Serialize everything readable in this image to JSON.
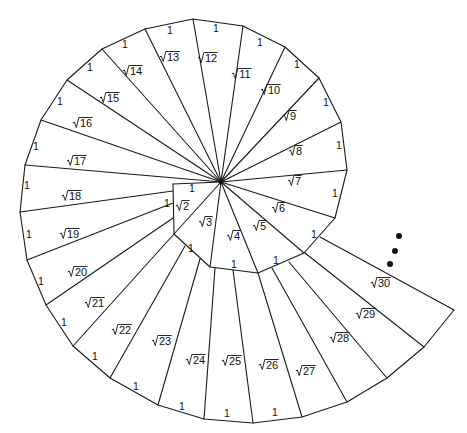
{
  "figure": {
    "center": [
      221,
      182
    ],
    "colors": {
      "line": "#1a1a1a",
      "background": "#ffffff",
      "dot": "#111111"
    },
    "vertices": [
      [
        173,
        184
      ],
      [
        174,
        234
      ],
      [
        210,
        267
      ],
      [
        258,
        273
      ],
      [
        304,
        253
      ],
      [
        335,
        218
      ],
      [
        347,
        170
      ],
      [
        341,
        122
      ],
      [
        319,
        78
      ],
      [
        285,
        47
      ],
      [
        243,
        26
      ],
      [
        193,
        19
      ],
      [
        145,
        29
      ],
      [
        102,
        49
      ],
      [
        67,
        80
      ],
      [
        41,
        120
      ],
      [
        25,
        165
      ],
      [
        20,
        212
      ],
      [
        27,
        260
      ],
      [
        46,
        305
      ],
      [
        73,
        346
      ],
      [
        110,
        378
      ],
      [
        158,
        405
      ],
      [
        204,
        419
      ],
      [
        253,
        423
      ],
      [
        302,
        417
      ],
      [
        347,
        402
      ],
      [
        387,
        378
      ],
      [
        424,
        347
      ],
      [
        454,
        310
      ]
    ],
    "hypotenuse_starts": {
      "18": [
        173,
        191
      ],
      "19": [
        173,
        203
      ],
      "20": [
        173,
        218
      ],
      "21": [
        174,
        234
      ],
      "22": [
        185,
        246
      ],
      "23": [
        200,
        259
      ],
      "24": [
        215,
        268
      ],
      "25": [
        233,
        270
      ],
      "26": [
        258,
        273
      ],
      "27": [
        272,
        268
      ],
      "28": [
        289,
        262
      ],
      "29": [
        305,
        253
      ],
      "30": [
        320,
        237
      ]
    },
    "radical_labels": [
      {
        "n": "2",
        "x": 184,
        "y": 210
      },
      {
        "n": "3",
        "x": 207,
        "y": 226
      },
      {
        "n": "4",
        "x": 235,
        "y": 240
      },
      {
        "n": "5",
        "x": 261,
        "y": 230
      },
      {
        "n": "6",
        "x": 280,
        "y": 212
      },
      {
        "n": "7",
        "x": 296,
        "y": 185
      },
      {
        "n": "8",
        "x": 297,
        "y": 155
      },
      {
        "n": "9",
        "x": 291,
        "y": 120
      },
      {
        "n": "10",
        "x": 272,
        "y": 94
      },
      {
        "n": "11",
        "x": 243,
        "y": 78
      },
      {
        "n": "12",
        "x": 209,
        "y": 62
      },
      {
        "n": "13",
        "x": 171,
        "y": 61
      },
      {
        "n": "14",
        "x": 134,
        "y": 75
      },
      {
        "n": "15",
        "x": 111,
        "y": 102
      },
      {
        "n": "16",
        "x": 84,
        "y": 127
      },
      {
        "n": "17",
        "x": 78,
        "y": 165
      },
      {
        "n": "18",
        "x": 73,
        "y": 200
      },
      {
        "n": "19",
        "x": 71,
        "y": 238
      },
      {
        "n": "20",
        "x": 79,
        "y": 276
      },
      {
        "n": "21",
        "x": 96,
        "y": 307
      },
      {
        "n": "22",
        "x": 123,
        "y": 334
      },
      {
        "n": "23",
        "x": 163,
        "y": 345
      },
      {
        "n": "24",
        "x": 197,
        "y": 364
      },
      {
        "n": "25",
        "x": 233,
        "y": 365
      },
      {
        "n": "26",
        "x": 270,
        "y": 369
      },
      {
        "n": "27",
        "x": 307,
        "y": 375
      },
      {
        "n": "28",
        "x": 341,
        "y": 342
      },
      {
        "n": "29",
        "x": 367,
        "y": 318
      },
      {
        "n": "30",
        "x": 382,
        "y": 287
      }
    ],
    "unit_labels": [
      {
        "text": "1",
        "x": 192,
        "y": 192
      },
      {
        "text": "1",
        "x": 167,
        "y": 207
      },
      {
        "text": "1",
        "x": 191,
        "y": 252
      },
      {
        "text": "1",
        "x": 234,
        "y": 268
      },
      {
        "text": "1",
        "x": 276,
        "y": 264
      },
      {
        "text": "1",
        "x": 314,
        "y": 238
      },
      {
        "text": "1",
        "x": 335,
        "y": 197
      },
      {
        "text": "1",
        "x": 339,
        "y": 149
      },
      {
        "text": "1",
        "x": 326,
        "y": 106
      },
      {
        "text": "1",
        "x": 297,
        "y": 68
      },
      {
        "text": "1",
        "x": 260,
        "y": 46
      },
      {
        "text": "1",
        "x": 216,
        "y": 32
      },
      {
        "text": "1",
        "x": 170,
        "y": 34
      },
      {
        "text": "1",
        "x": 125,
        "y": 48
      },
      {
        "text": "1",
        "x": 90,
        "y": 71
      },
      {
        "text": "1",
        "x": 60,
        "y": 105
      },
      {
        "text": "1",
        "x": 36,
        "y": 150
      },
      {
        "text": "1",
        "x": 27,
        "y": 189
      },
      {
        "text": "1",
        "x": 29,
        "y": 238
      },
      {
        "text": "1",
        "x": 41,
        "y": 285
      },
      {
        "text": "1",
        "x": 64,
        "y": 326
      },
      {
        "text": "1",
        "x": 95,
        "y": 360
      },
      {
        "text": "1",
        "x": 136,
        "y": 390
      },
      {
        "text": "1",
        "x": 182,
        "y": 410
      },
      {
        "text": "1",
        "x": 227,
        "y": 417
      },
      {
        "text": "1",
        "x": 275,
        "y": 416
      }
    ],
    "continuation_dots": [
      [
        399,
        236
      ],
      [
        395,
        251
      ],
      [
        390,
        264
      ]
    ]
  }
}
